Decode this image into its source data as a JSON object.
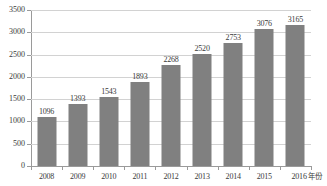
{
  "chart_data": {
    "type": "bar",
    "title": "",
    "subtitle": "",
    "xlabel": "年份",
    "ylabel": "",
    "categories": [
      "2008",
      "2009",
      "2010",
      "2011",
      "2012",
      "2013",
      "2014",
      "2015",
      "2016"
    ],
    "values": [
      1096,
      1393,
      1543,
      1893,
      2268,
      2520,
      2753,
      3076,
      3165
    ],
    "data_labels": [
      "1096",
      "1393",
      "1543",
      "1893",
      "2268",
      "2520",
      "2753",
      "3076",
      "3165"
    ],
    "ylim": [
      0,
      3500
    ],
    "yticks": [
      0,
      500,
      1000,
      1500,
      2000,
      2500,
      3000,
      3500
    ],
    "ytick_labels": [
      "0",
      "500",
      "1000",
      "1500",
      "2000",
      "2500",
      "3000",
      "3500"
    ],
    "grid": true,
    "grid_axis": "y",
    "legend": null,
    "legend_position": "none",
    "bar_color": "#808080",
    "grid_color": "#d2d2d2",
    "axis_color": "#9a9a9a",
    "text_color": "#3a3a3a",
    "background_color": "#ffffff"
  }
}
